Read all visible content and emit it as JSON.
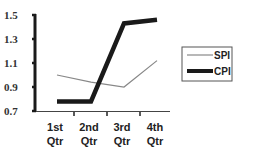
{
  "chart_data": {
    "type": "line",
    "title": "",
    "xlabel": "",
    "ylabel": "",
    "categories": [
      "1st Qtr",
      "2nd Qtr",
      "3rd Qtr",
      "4th Qtr"
    ],
    "category_lines": [
      [
        "1st",
        "Qtr"
      ],
      [
        "2nd",
        "Qtr"
      ],
      [
        "3rd",
        "Qtr"
      ],
      [
        "4th",
        "Qtr"
      ]
    ],
    "yticks": [
      "1.5",
      "1.3",
      "1.1",
      "0.9",
      "0.7"
    ],
    "ylim": [
      0.7,
      1.5
    ],
    "grid": false,
    "legend_position": "right",
    "series": [
      {
        "name": "SPI",
        "values": [
          1.0,
          0.94,
          0.9,
          1.12
        ],
        "color": "#888888",
        "width": 1.2
      },
      {
        "name": "CPI",
        "values": [
          0.78,
          0.78,
          1.43,
          1.46
        ],
        "color": "#1a1a1a",
        "width": 4.5
      }
    ]
  },
  "legend": {
    "items": [
      {
        "label": "SPI"
      },
      {
        "label": "CPI"
      }
    ]
  }
}
